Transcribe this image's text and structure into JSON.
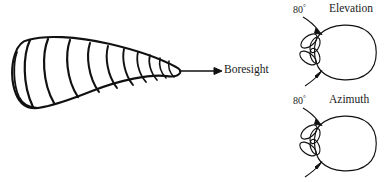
{
  "figure": {
    "background_color": "#ffffff",
    "ink_color": "#111111",
    "width": 384,
    "height": 182
  },
  "antenna": {
    "name": "conical-spiral-antenna",
    "description": "Tapered conical horn drawn with ten curved cross-section arcs, wide rounded base at left narrowing to a rounded tip at right",
    "arc_count": 10,
    "base_side": "left",
    "tip_side": "right"
  },
  "boresight": {
    "label": "Boresight",
    "arrow_direction": "right",
    "arrow_start_x": 178,
    "arrow_end_x": 220,
    "arrow_y": 71
  },
  "patterns": [
    {
      "id": "elevation",
      "title": "Elevation",
      "beamwidth": "80",
      "degree_symbol": "°",
      "main_lobe_direction": "right",
      "side_lobe_count": 4,
      "beamwidth_arrows": 2
    },
    {
      "id": "azimuth",
      "title": "Azimuth",
      "beamwidth": "80",
      "degree_symbol": "°",
      "main_lobe_direction": "right",
      "side_lobe_count": 4,
      "beamwidth_arrows": 2
    }
  ]
}
